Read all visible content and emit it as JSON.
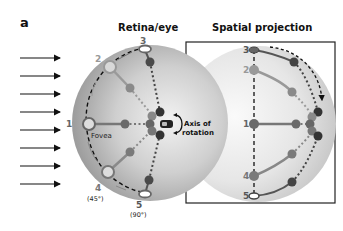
{
  "panel_label": "a",
  "titles": {
    "retina": "Retina/eye",
    "projection": "Spatial projection"
  },
  "retina_points": {
    "p1": "1",
    "p2": "2",
    "p3": "3",
    "p4": "4",
    "p5": "5",
    "p4_angle": "(45°)",
    "p5_angle": "(90°)",
    "fovea": "Fovea"
  },
  "axis_label": {
    "line1": "Axis of",
    "line2": "rotation"
  },
  "projection_points": {
    "p1": "1",
    "p2": "2",
    "p3": "3",
    "p4": "4",
    "p5": "5"
  },
  "colors": {
    "dark_node": "#3a3a3a",
    "mid_node": "#7a7a7a",
    "light_node": "#9a9a9a",
    "label_gray": "#8c8c8c",
    "sphere_light": "#f4f4f4",
    "sphere_dark": "#9e9e9e"
  }
}
